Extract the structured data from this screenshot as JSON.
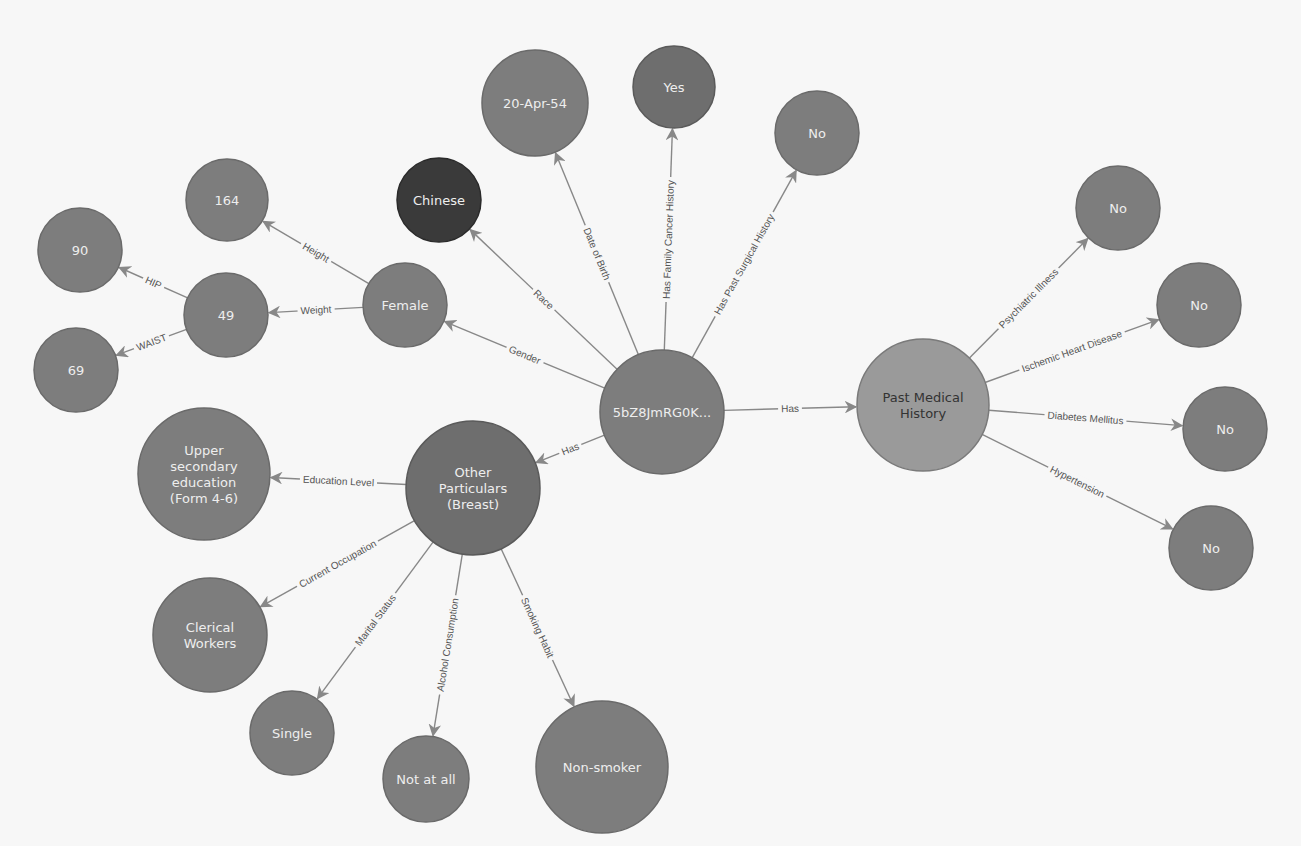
{
  "graph": {
    "palette": {
      "background": "#f7f7f7",
      "edge": "#888888",
      "edge_label": "#555555",
      "node_default": "#7d7d7d",
      "node_stroke": "#6a6a6a",
      "node_dark": "#3a3a3a",
      "node_medium": "#6e6e6e",
      "node_light": "#9a9a9a",
      "label_light": "#eeeeee",
      "label_dark": "#333333"
    },
    "nodes": [
      {
        "id": "patient",
        "label": "5bZ8JmRG0K...",
        "tone": "default"
      },
      {
        "id": "race",
        "label": "Chinese",
        "tone": "dark"
      },
      {
        "id": "dob",
        "label": "20-Apr-54",
        "tone": "default"
      },
      {
        "id": "family_cancer",
        "label": "Yes",
        "tone": "medium"
      },
      {
        "id": "past_surgical",
        "label": "No",
        "tone": "default"
      },
      {
        "id": "gender",
        "label": "Female",
        "tone": "default"
      },
      {
        "id": "height",
        "label": "164",
        "tone": "default"
      },
      {
        "id": "weight",
        "label": "49",
        "tone": "default"
      },
      {
        "id": "hip",
        "label": "90",
        "tone": "default"
      },
      {
        "id": "waist",
        "label": "69",
        "tone": "default"
      },
      {
        "id": "other",
        "label": "Other\nParticulars\n(Breast)",
        "tone": "medium"
      },
      {
        "id": "education",
        "label": "Upper\nsecondary\neducation\n(Form 4-6)",
        "tone": "default"
      },
      {
        "id": "occupation",
        "label": "Clerical\nWorkers",
        "tone": "default"
      },
      {
        "id": "marital",
        "label": "Single",
        "tone": "default"
      },
      {
        "id": "alcohol",
        "label": "Not at all",
        "tone": "default"
      },
      {
        "id": "smoking",
        "label": "Non-smoker",
        "tone": "default"
      },
      {
        "id": "pmh",
        "label": "Past Medical\nHistory",
        "tone": "light"
      },
      {
        "id": "psychiatric",
        "label": "No",
        "tone": "default"
      },
      {
        "id": "ischemic",
        "label": "No",
        "tone": "default"
      },
      {
        "id": "diabetes",
        "label": "No",
        "tone": "default"
      },
      {
        "id": "hypertension",
        "label": "No",
        "tone": "default"
      }
    ],
    "edges": [
      {
        "from": "patient",
        "to": "race",
        "label": "Race"
      },
      {
        "from": "patient",
        "to": "dob",
        "label": "Date of Birth"
      },
      {
        "from": "patient",
        "to": "family_cancer",
        "label": "Has Family Cancer History"
      },
      {
        "from": "patient",
        "to": "past_surgical",
        "label": "Has Past Surgical History"
      },
      {
        "from": "patient",
        "to": "gender",
        "label": "Gender"
      },
      {
        "from": "patient",
        "to": "other",
        "label": "Has"
      },
      {
        "from": "patient",
        "to": "pmh",
        "label": "Has"
      },
      {
        "from": "gender",
        "to": "height",
        "label": "Height"
      },
      {
        "from": "gender",
        "to": "weight",
        "label": "Weight"
      },
      {
        "from": "weight",
        "to": "hip",
        "label": "HIP"
      },
      {
        "from": "weight",
        "to": "waist",
        "label": "WAIST"
      },
      {
        "from": "other",
        "to": "education",
        "label": "Education Level"
      },
      {
        "from": "other",
        "to": "occupation",
        "label": "Current Occupation"
      },
      {
        "from": "other",
        "to": "marital",
        "label": "Marital Status"
      },
      {
        "from": "other",
        "to": "alcohol",
        "label": "Alcohol Consumption"
      },
      {
        "from": "other",
        "to": "smoking",
        "label": "Smoking Habit"
      },
      {
        "from": "pmh",
        "to": "psychiatric",
        "label": "Psychiatric Illness"
      },
      {
        "from": "pmh",
        "to": "ischemic",
        "label": "Ischemic Heart Disease"
      },
      {
        "from": "pmh",
        "to": "diabetes",
        "label": "Diabetes Mellitus"
      },
      {
        "from": "pmh",
        "to": "hypertension",
        "label": "Hypertension"
      }
    ]
  }
}
